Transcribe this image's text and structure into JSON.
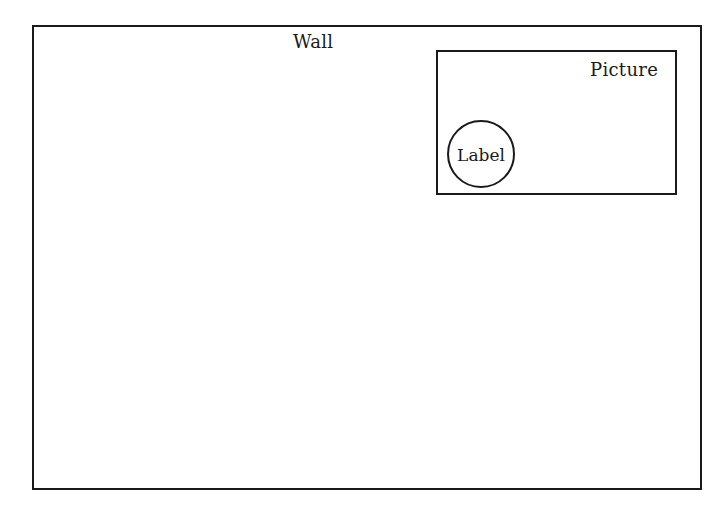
{
  "diagram": {
    "wall": {
      "label": "Wall"
    },
    "picture": {
      "label": "Picture"
    },
    "label_node": {
      "label": "Label"
    },
    "relations": [
      {
        "child": "Picture",
        "parent": "Wall",
        "type": "contained-in"
      },
      {
        "child": "Label",
        "parent": "Picture",
        "type": "contained-in"
      }
    ],
    "colors": {
      "stroke": "#1a1a1a",
      "background": "#ffffff"
    }
  }
}
